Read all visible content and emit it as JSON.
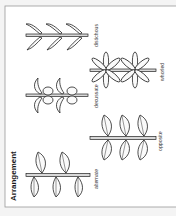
{
  "figure": {
    "title": "Arrangement",
    "orientation": "rotated 90 degrees counter-clockwise",
    "background": "#ffffff",
    "frame_color": "#9a9a9a",
    "panels": [
      {
        "id": "alternate",
        "label": "alternate"
      },
      {
        "id": "opposite",
        "label": "opposite"
      },
      {
        "id": "decussate",
        "label": "decussate"
      },
      {
        "id": "whorled",
        "label": "whorled"
      },
      {
        "id": "distichous",
        "label": "distichous"
      }
    ]
  }
}
